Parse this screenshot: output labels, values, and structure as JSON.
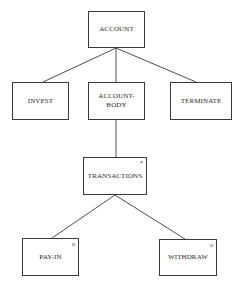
{
  "diagram": {
    "type": "jackson-structure-diagram",
    "nodes": {
      "account": {
        "label": "ACCOUNT",
        "marker": ""
      },
      "invest": {
        "label": "INVEST",
        "marker": ""
      },
      "account_body": {
        "label": "ACCOUNT-\nBODY",
        "marker": ""
      },
      "terminate": {
        "label": "TERMINATE",
        "marker": ""
      },
      "transactions": {
        "label": "TRANSACTIONS",
        "marker": "*"
      },
      "pay_in": {
        "label": "PAY-IN",
        "marker": "o"
      },
      "withdraw": {
        "label": "WITHDRAW",
        "marker": "o"
      }
    },
    "edges": [
      {
        "from": "ACCOUNT",
        "to": "INVEST"
      },
      {
        "from": "ACCOUNT",
        "to": "ACCOUNT-BODY"
      },
      {
        "from": "ACCOUNT",
        "to": "TERMINATE"
      },
      {
        "from": "ACCOUNT-BODY",
        "to": "TRANSACTIONS"
      },
      {
        "from": "TRANSACTIONS",
        "to": "PAY-IN"
      },
      {
        "from": "TRANSACTIONS",
        "to": "WITHDRAW"
      }
    ]
  }
}
